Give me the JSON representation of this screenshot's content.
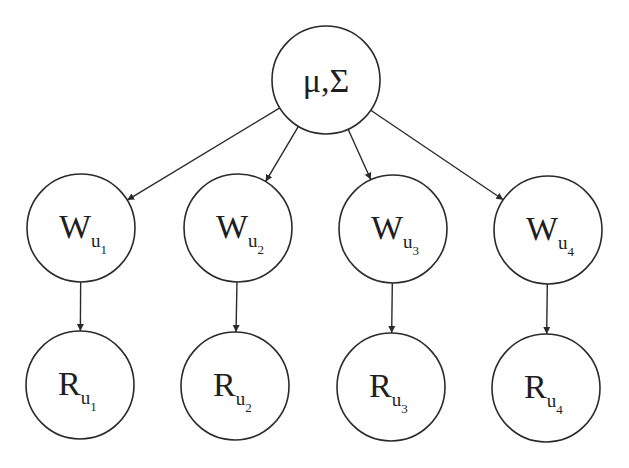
{
  "diagram": {
    "type": "graphical-model",
    "root": {
      "id": "mu-sigma",
      "label": "μ,Σ",
      "cx": 326,
      "cy": 80,
      "r": 54
    },
    "w_nodes": [
      {
        "id": "W_u1",
        "base": "W",
        "sub": "u",
        "index": "1",
        "cx": 81,
        "cy": 228,
        "r": 54
      },
      {
        "id": "W_u2",
        "base": "W",
        "sub": "u",
        "index": "2",
        "cx": 238,
        "cy": 228,
        "r": 54
      },
      {
        "id": "W_u3",
        "base": "W",
        "sub": "u",
        "index": "3",
        "cx": 393,
        "cy": 229,
        "r": 54
      },
      {
        "id": "W_u4",
        "base": "W",
        "sub": "u",
        "index": "4",
        "cx": 548,
        "cy": 230,
        "r": 54
      }
    ],
    "r_nodes": [
      {
        "id": "R_u1",
        "base": "R",
        "sub": "u",
        "index": "1",
        "cx": 80,
        "cy": 385,
        "r": 54
      },
      {
        "id": "R_u2",
        "base": "R",
        "sub": "u",
        "index": "2",
        "cx": 235,
        "cy": 386,
        "r": 54
      },
      {
        "id": "R_u3",
        "base": "R",
        "sub": "u",
        "index": "3",
        "cx": 391,
        "cy": 387,
        "r": 54
      },
      {
        "id": "R_u4",
        "base": "R",
        "sub": "u",
        "index": "4",
        "cx": 546,
        "cy": 388,
        "r": 54
      }
    ],
    "edges": [
      {
        "from": "mu-sigma",
        "to": "W_u1"
      },
      {
        "from": "mu-sigma",
        "to": "W_u2"
      },
      {
        "from": "mu-sigma",
        "to": "W_u3"
      },
      {
        "from": "mu-sigma",
        "to": "W_u4"
      },
      {
        "from": "W_u1",
        "to": "R_u1"
      },
      {
        "from": "W_u2",
        "to": "R_u2"
      },
      {
        "from": "W_u3",
        "to": "R_u3"
      },
      {
        "from": "W_u4",
        "to": "R_u4"
      }
    ],
    "colors": {
      "stroke": "#2a2a2a",
      "text": "#1e1e1e",
      "background": "#ffffff"
    }
  }
}
